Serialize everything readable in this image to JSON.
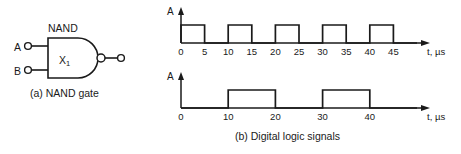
{
  "figure": {
    "parts": [
      {
        "id": "a",
        "caption": "(a) NAND gate"
      },
      {
        "id": "b",
        "caption": "(b) Digital logic signals"
      }
    ]
  },
  "gate": {
    "type_label": "NAND",
    "designator": "X",
    "designator_subscript": "1",
    "inputs": [
      {
        "label": "A"
      },
      {
        "label": "B"
      }
    ],
    "output": {
      "label": "",
      "inverting_bubble": true
    },
    "caption": "(a) NAND gate"
  },
  "waveforms": {
    "caption": "(b) Digital logic signals",
    "y_axis_label": "A",
    "x_axis_label": "t, µs",
    "charts": [
      {
        "name": "top-signal",
        "y_axis_label": "A",
        "x_axis_label": "t, µs",
        "tick_labels": [
          "0",
          "5",
          "10",
          "15",
          "20",
          "25",
          "30",
          "35",
          "40",
          "45"
        ]
      },
      {
        "name": "bottom-signal",
        "y_axis_label": "A",
        "x_axis_label": "t, µs",
        "tick_labels": [
          "0",
          "10",
          "20",
          "30",
          "40"
        ]
      }
    ]
  },
  "colors": {
    "ink": "#1a1a1a",
    "background": "#ffffff"
  },
  "chart_data": [
    {
      "type": "line",
      "name": "top-signal",
      "title": "",
      "xlabel": "t, µs",
      "ylabel": "A",
      "xlim": [
        0,
        50
      ],
      "ylim": [
        0,
        1.4
      ],
      "grid": false,
      "legend": "none",
      "xticks": [
        0,
        5,
        10,
        15,
        20,
        25,
        30,
        35,
        40,
        45
      ],
      "xtick_labels": [
        "0",
        "5",
        "10",
        "15",
        "20",
        "25",
        "30",
        "35",
        "40",
        "45"
      ],
      "yticks": [],
      "waveform": "square",
      "pulses": [
        {
          "start": 0,
          "end": 5,
          "level": 1
        },
        {
          "start": 10,
          "end": 15,
          "level": 1
        },
        {
          "start": 20,
          "end": 25,
          "level": 1
        },
        {
          "start": 30,
          "end": 35,
          "level": 1
        },
        {
          "start": 40,
          "end": 45,
          "level": 1
        }
      ],
      "x": [
        0,
        0,
        5,
        5,
        10,
        10,
        15,
        15,
        20,
        20,
        25,
        25,
        30,
        30,
        35,
        35,
        40,
        40,
        45,
        45,
        50
      ],
      "y": [
        0,
        1,
        1,
        0,
        0,
        1,
        1,
        0,
        0,
        1,
        1,
        0,
        0,
        1,
        1,
        0,
        0,
        1,
        1,
        0,
        0
      ]
    },
    {
      "type": "line",
      "name": "bottom-signal",
      "title": "",
      "xlabel": "t, µs",
      "ylabel": "A",
      "xlim": [
        0,
        50
      ],
      "ylim": [
        0,
        1.4
      ],
      "grid": false,
      "legend": "none",
      "xticks": [
        0,
        10,
        20,
        30,
        40
      ],
      "xtick_labels": [
        "0",
        "10",
        "20",
        "30",
        "40"
      ],
      "yticks": [],
      "waveform": "square",
      "pulses": [
        {
          "start": 10,
          "end": 20,
          "level": 1
        },
        {
          "start": 30,
          "end": 40,
          "level": 1
        }
      ],
      "x": [
        0,
        10,
        10,
        20,
        20,
        30,
        30,
        40,
        40,
        50
      ],
      "y": [
        0,
        0,
        1,
        1,
        0,
        0,
        1,
        1,
        0,
        0
      ]
    }
  ]
}
